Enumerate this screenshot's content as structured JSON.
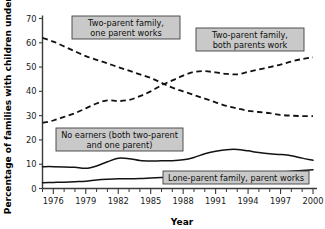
{
  "chart_data": {
    "type": "line",
    "title": "",
    "xlabel": "Year",
    "ylabel": "Percentage of families with children under 6",
    "xlim": [
      1975,
      2000
    ],
    "ylim": [
      0,
      70
    ],
    "grid": false,
    "legend_position": "inline-annotations",
    "y_ticks": [
      "0",
      "10",
      "20",
      "30",
      "40",
      "50",
      "60",
      "70"
    ],
    "y_tick_values": [
      0,
      10,
      20,
      30,
      40,
      50,
      60,
      70
    ],
    "x_ticks": [
      "1976",
      "1979",
      "1982",
      "1985",
      "1988",
      "1991",
      "1994",
      "1997",
      "2000"
    ],
    "x_tick_values": [
      1976,
      1979,
      1982,
      1985,
      1988,
      1991,
      1994,
      1997,
      2000
    ],
    "x_minor_tick_values": [
      1975,
      1977,
      1978,
      1980,
      1981,
      1983,
      1984,
      1986,
      1987,
      1989,
      1990,
      1992,
      1993,
      1995,
      1996,
      1998,
      1999
    ],
    "x": [
      1975,
      1976,
      1977,
      1978,
      1979,
      1980,
      1981,
      1982,
      1983,
      1984,
      1985,
      1986,
      1987,
      1988,
      1989,
      1990,
      1991,
      1992,
      1993,
      1994,
      1995,
      1996,
      1997,
      1998,
      1999,
      2000
    ],
    "series": [
      {
        "name": "Two-parent family, one parent works",
        "style": "dashed",
        "values": [
          62.0,
          60.5,
          58.5,
          56.5,
          54.5,
          53.0,
          51.5,
          50.0,
          48.5,
          47.0,
          45.5,
          43.5,
          41.5,
          40.0,
          38.5,
          37.0,
          35.5,
          34.0,
          33.0,
          32.0,
          31.5,
          31.0,
          30.3,
          30.0,
          29.8,
          29.8
        ]
      },
      {
        "name": "Two-parent family, both parents work",
        "style": "dashed",
        "values": [
          27.0,
          28.0,
          29.5,
          31.0,
          33.0,
          35.0,
          36.3,
          36.0,
          36.5,
          38.0,
          40.0,
          42.5,
          44.5,
          46.5,
          48.0,
          48.3,
          47.8,
          47.2,
          47.0,
          48.0,
          49.0,
          50.0,
          51.0,
          52.3,
          53.3,
          54.0
        ]
      },
      {
        "name": "No earners (both two-parent and one parent)",
        "style": "solid",
        "values": [
          9.0,
          9.0,
          8.9,
          8.7,
          8.3,
          9.3,
          11.0,
          12.5,
          12.3,
          11.5,
          11.3,
          11.4,
          11.4,
          11.8,
          12.8,
          14.3,
          15.3,
          16.0,
          16.1,
          15.5,
          14.8,
          14.3,
          14.0,
          13.5,
          12.5,
          11.6
        ]
      },
      {
        "name": "Lone-parent family, parent works",
        "style": "solid",
        "values": [
          2.4,
          2.5,
          2.6,
          2.8,
          3.0,
          3.5,
          3.8,
          4.0,
          4.0,
          4.1,
          4.3,
          4.5,
          4.7,
          5.0,
          5.2,
          5.4,
          5.6,
          5.7,
          5.8,
          6.0,
          6.2,
          6.4,
          6.7,
          7.1,
          7.4,
          7.7
        ]
      }
    ],
    "annotations": [
      {
        "id": "ann-one-parent-works",
        "lines": [
          "Two-parent family,",
          "one parent works"
        ],
        "box_x": 72,
        "box_y": 16,
        "box_w": 108,
        "box_h": 23
      },
      {
        "id": "ann-both-parents-work",
        "lines": [
          "Two-parent family,",
          "both parents work"
        ],
        "box_x": 196,
        "box_y": 28,
        "box_w": 108,
        "box_h": 23
      },
      {
        "id": "ann-no-earners",
        "lines": [
          "No earners (both two-parent",
          "and one parent)"
        ],
        "box_x": 56,
        "box_y": 128,
        "box_w": 127,
        "box_h": 23
      },
      {
        "id": "ann-lone-parent",
        "lines": [
          "Lone-parent family, parent works"
        ],
        "box_x": 163,
        "box_y": 171,
        "box_w": 146,
        "box_h": 13
      }
    ]
  },
  "colors": {
    "line": "#121212",
    "axis": "#3a3a3a",
    "label_box_fill": "#c9c9c9",
    "label_box_stroke": "#3f3f3f",
    "background": "#ffffff"
  }
}
